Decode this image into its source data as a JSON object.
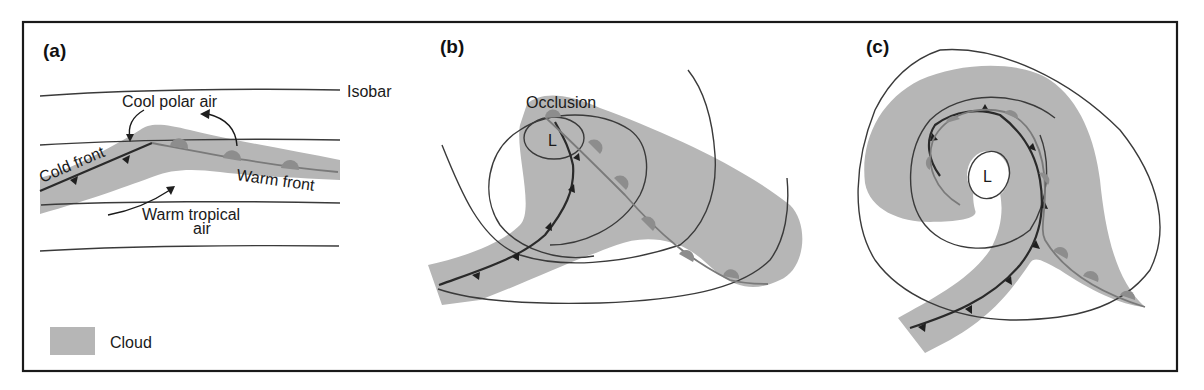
{
  "figure": {
    "border_color": "#1a1a1a",
    "colors": {
      "cloud": "#b6b6b6",
      "cold_front": "#2a2a2a",
      "warm_front": "#7a7a7a",
      "warm_front_bumps": "#8d8d8d",
      "isobar": "#3a3a3a"
    },
    "panels": [
      {
        "id": "a",
        "label": "(a)",
        "annotations": {
          "isobar": "Isobar",
          "cool_air": "Cool polar air",
          "cold_front": "Cold front",
          "warm_front": "Warm front",
          "warm_air_line1": "Warm tropical",
          "warm_air_line2": "air"
        }
      },
      {
        "id": "b",
        "label": "(b)",
        "annotations": {
          "occlusion": "Occlusion",
          "low": "L"
        }
      },
      {
        "id": "c",
        "label": "(c)",
        "annotations": {
          "low": "L"
        }
      }
    ],
    "legend": {
      "items": [
        {
          "symbol": "cloud-swatch",
          "label": "Cloud"
        }
      ]
    }
  }
}
